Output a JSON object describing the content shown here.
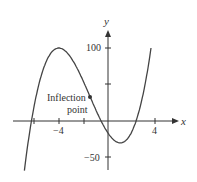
{
  "chart_data": {
    "type": "line",
    "title": "",
    "xlabel": "x",
    "ylabel": "y",
    "x_ticks": [
      -6,
      -4,
      -2,
      2,
      4
    ],
    "x_tick_labels": [
      "-4",
      "4"
    ],
    "y_tick_labels": [
      "100",
      "-50"
    ],
    "xlim": [
      -7.5,
      7
    ],
    "ylim": [
      -65,
      130
    ],
    "grid": false,
    "series": [
      {
        "name": "f(x)",
        "function": "2.08(x^3+4.5x^2-12x)-16.5",
        "local_max": [
          -4,
          100
        ],
        "local_min": [
          1,
          -30
        ],
        "inflection": [
          -1.5,
          35
        ]
      }
    ],
    "annotations": [
      {
        "text": "Inflection point",
        "x": -1.5,
        "y": 35
      }
    ]
  },
  "labels": {
    "x": "x",
    "y": "y",
    "xt_neg": "−4",
    "xt_pos": "4",
    "yt_pos": "100",
    "yt_neg": "−50",
    "ann1": "Inflection",
    "ann2": "point"
  }
}
